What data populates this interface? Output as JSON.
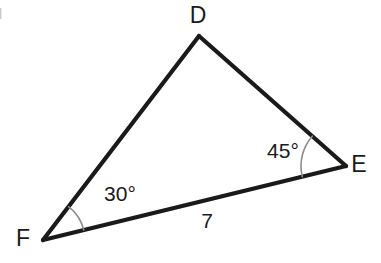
{
  "figure": {
    "type": "geometry-triangle-diagram",
    "background_color": "#ffffff",
    "stroke_color": "#1a1a1a",
    "arc_color": "#8c8c8c",
    "width": 381,
    "height": 263,
    "vertices": [
      {
        "name": "D",
        "label": "D",
        "x": 199,
        "y": 36,
        "label_x": 198,
        "label_y": 17
      },
      {
        "name": "E",
        "label": "E",
        "x": 346,
        "y": 166,
        "label_x": 359,
        "label_y": 166
      },
      {
        "name": "F",
        "label": "F",
        "x": 43,
        "y": 240,
        "label_x": 23,
        "label_y": 240
      }
    ],
    "sides": [
      {
        "name": "FD",
        "from": "F",
        "to": "D",
        "label": ""
      },
      {
        "name": "DE",
        "from": "D",
        "to": "E",
        "label": ""
      },
      {
        "name": "FE",
        "from": "F",
        "to": "E",
        "label": "7",
        "label_x": 207,
        "label_y": 222
      }
    ],
    "angles": [
      {
        "at": "F",
        "label": "30°",
        "value": 30,
        "radius": 42,
        "label_x": 120,
        "label_y": 195
      },
      {
        "at": "E",
        "label": "45°",
        "value": 45,
        "radius": 45,
        "label_x": 283,
        "label_y": 152
      }
    ]
  }
}
